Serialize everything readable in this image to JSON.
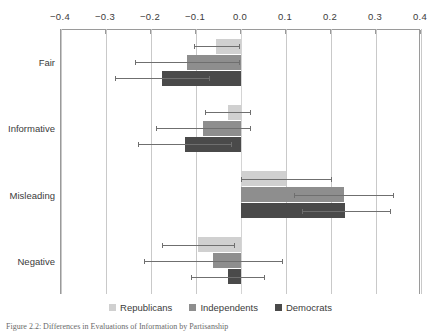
{
  "chart_data": {
    "type": "bar",
    "orientation": "horizontal",
    "title": "",
    "xlabel": "",
    "ylabel": "",
    "xlim": [
      -0.4,
      0.4
    ],
    "xticks": [
      -0.4,
      -0.3,
      -0.2,
      -0.1,
      0.0,
      0.1,
      0.2,
      0.3,
      0.4
    ],
    "xtick_labels": [
      "−0.4",
      "−0.3",
      "−0.2",
      "−0.1",
      "0.0",
      "0.1",
      "0.2",
      "0.3",
      "0.4"
    ],
    "grid": true,
    "legend_position": "bottom",
    "categories": [
      "Fair",
      "Informative",
      "Misleading",
      "Negative"
    ],
    "series": [
      {
        "name": "Republicans",
        "color": "#d0d0d0",
        "values": [
          -0.055,
          -0.03,
          0.1,
          -0.095
        ],
        "ci_low": [
          -0.105,
          -0.08,
          0.0,
          -0.175
        ],
        "ci_high": [
          -0.005,
          0.02,
          0.2,
          -0.015
        ]
      },
      {
        "name": "Independents",
        "color": "#8e8e8e",
        "values": [
          -0.12,
          -0.085,
          0.228,
          -0.062
        ],
        "ci_low": [
          -0.235,
          -0.19,
          0.118,
          -0.215
        ],
        "ci_high": [
          -0.005,
          0.02,
          0.338,
          0.09
        ]
      },
      {
        "name": "Democrats",
        "color": "#4a4a4a",
        "values": [
          -0.175,
          -0.125,
          0.232,
          -0.03
        ],
        "ci_low": [
          -0.28,
          -0.23,
          0.135,
          -0.112
        ],
        "ci_high": [
          -0.072,
          -0.022,
          0.33,
          0.052
        ]
      }
    ]
  },
  "legend": {
    "items": [
      {
        "label": "Republicans",
        "swatch": "rep"
      },
      {
        "label": "Independents",
        "swatch": "ind"
      },
      {
        "label": "Democrats",
        "swatch": "dem"
      }
    ]
  },
  "caption": {
    "text": "Figure 2.2:  Differences in Evaluations of Information by Partisanship"
  }
}
